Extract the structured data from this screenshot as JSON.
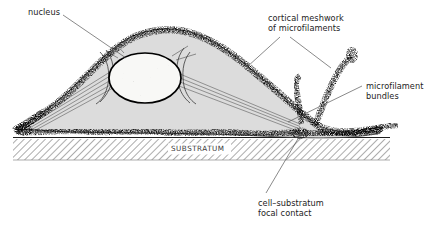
{
  "figure": {
    "type": "biological-cross-section-diagram",
    "background_color": "#ffffff",
    "ink_color": "#1d1d1d"
  },
  "labels": {
    "nucleus": "nucleus",
    "cortical_meshwork_line1": "cortical meshwork",
    "cortical_meshwork_line2": "of microfilaments",
    "microfilament_bundles_line1": "microfilament",
    "microfilament_bundles_line2": "bundles",
    "focal_contact_line1": "cell–substratum",
    "focal_contact_line2": "focal contact",
    "substratum": "SUBSTRATUM"
  },
  "structures": {
    "cytoplasm": {
      "name": "cytoplasm",
      "fill_color": "#dcdcdc",
      "stroke_color": "#1d1d1d"
    },
    "nucleus": {
      "name": "nucleus",
      "shape": "ellipse",
      "center_x": 145,
      "center_y": 78,
      "radius_x": 36,
      "radius_y": 25,
      "fill_color": "#f7f7f5",
      "stroke_color": "#000000",
      "stroke_width": 1.6
    },
    "cortical_meshwork": {
      "name": "cortical meshwork of microfilaments",
      "appearance": "stippled dark speckled band along cell periphery",
      "color": "#1a1a1a"
    },
    "microfilament_bundles": {
      "name": "microfilament bundles",
      "appearance": "parallel thin lines radiating from nucleus to cell margins",
      "color": "#4a4a4a"
    },
    "focal_contacts": {
      "name": "cell-substratum focal contacts",
      "count": 2,
      "appearance": "dense dark attachment points where cell meets substratum"
    },
    "filopodia": {
      "name": "filopodia",
      "count": 2,
      "appearance": "finger-like speckled projections on right side of cell"
    },
    "substratum": {
      "name": "substratum",
      "appearance": "diagonally hatched horizontal band",
      "x_start": 13,
      "x_end": 390,
      "y_top": 137,
      "y_bottom": 160,
      "hatch_color": "#6e6e6e",
      "line_color": "#1d1d1d"
    }
  },
  "leader_lines": {
    "nucleus": "from nucleus label down-right to nucleus body",
    "cortical_meshwork_left": "from label down-left to upper cell cortex",
    "cortical_meshwork_right": "from label down-right to filopodium",
    "microfilament_bundles": "from label down-left to bundle near cell base",
    "focal_contact": "from label up-right to contact point on substratum"
  }
}
